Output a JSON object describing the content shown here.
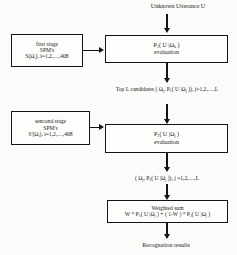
{
  "diagram": {
    "title_label": "Unknown Utterance U",
    "nodes": {
      "first_stage": {
        "line1": "first stage",
        "line2": "SPM's",
        "line3": "S(Ωi), i=1,2,…,408"
      },
      "first_eval": {
        "line1": "P1( U |Ωk )",
        "line2": "evaluation"
      },
      "second_stage": {
        "line1": "sencond stage",
        "line2": "SPM's",
        "line3": "S'(Ωi), i=1,2,…,408"
      },
      "second_eval": {
        "line1": "P2( U |Ωj )",
        "line2": "evaluation"
      },
      "weighted_sum": {
        "line1": "Weighted sum",
        "line2": "W * P1( U |Ωj ) + ( 1-W ) * P2( U |Ωj )"
      }
    },
    "annotations": {
      "top_candidates_line1": "Top L candidates",
      "top_candidates_line2": "( Ωj, P1( U |Ωj )), j=1,2,…,L",
      "second_pass_output": "( Ωj, P2( U |Ωj )), j =1,2,…,L",
      "recognition_results": "Recognation results"
    },
    "colors": {
      "stroke": "#141414",
      "background": "#fbfbf9",
      "box_fill": "#fdfdfc"
    }
  }
}
